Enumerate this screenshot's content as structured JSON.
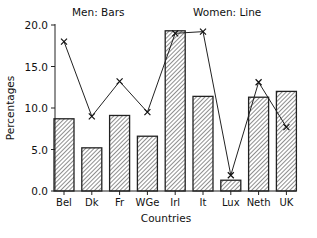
{
  "chart_data": {
    "type": "bar",
    "title": "",
    "xlabel": "Countries",
    "ylabel": "Percentages",
    "ylim": [
      0,
      20
    ],
    "yticks": [
      "0.0",
      "5.0",
      "10.0",
      "15.0",
      "20.0"
    ],
    "grid": false,
    "categories": [
      "Bel",
      "Dk",
      "Fr",
      "WGe",
      "Irl",
      "It",
      "Lux",
      "Neth",
      "UK"
    ],
    "annotations": [
      "Men: Bars",
      "Women: Line"
    ],
    "series": [
      {
        "name": "Men",
        "style": "hatched bars",
        "values": [
          8.7,
          5.2,
          9.1,
          6.6,
          19.3,
          11.4,
          1.3,
          11.3,
          12.0
        ]
      },
      {
        "name": "Women",
        "style": "line with x markers",
        "values": [
          18.0,
          9.0,
          13.2,
          9.5,
          19.0,
          19.2,
          1.9,
          13.1,
          7.7
        ]
      }
    ]
  }
}
